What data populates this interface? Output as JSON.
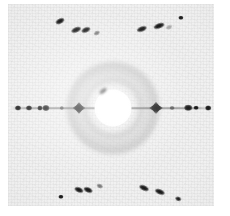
{
  "figure": {
    "kind": "x-ray-diffraction-pattern",
    "caption": "",
    "width": 230,
    "height": 216,
    "plate": {
      "x": 8,
      "y": 4,
      "width": 206,
      "height": 202
    },
    "background_color": "#f1f1f1",
    "page_color": "#ffffff",
    "spot_color": "#0c0c0c",
    "halo_color": "#787878",
    "beamstop_color": "#ffffff"
  },
  "chart_data": {
    "type": "scatter",
    "title": "",
    "subtitle": "",
    "xlabel": "",
    "ylabel": "",
    "grid": false,
    "legend": null,
    "xlim": [
      0,
      230
    ],
    "ylim": [
      0,
      216
    ],
    "annotations": [],
    "center": {
      "x": 113,
      "y": 108
    },
    "beamstop": {
      "cx": 113,
      "cy": 108,
      "r_white": 18.5,
      "r_ring": 23
    },
    "halo": [
      {
        "cx": 113,
        "cy": 108,
        "r": 46,
        "label": "outer diffuse ring"
      },
      {
        "cx": 113,
        "cy": 108,
        "r": 30,
        "label": "inner diffuse ring"
      }
    ],
    "layer_line": {
      "y": 108,
      "x0": 10,
      "x1": 212,
      "label": "horizontal layer line"
    },
    "series": [
      {
        "name": "equatorial reflections",
        "points": [
          {
            "x": 18,
            "y": 108,
            "rx": 3.0,
            "ry": 2.6,
            "rot": 0,
            "intensity": 0.85
          },
          {
            "x": 29,
            "y": 108,
            "rx": 3.0,
            "ry": 2.6,
            "rot": 0,
            "intensity": 0.9
          },
          {
            "x": 40,
            "y": 108,
            "rx": 2.6,
            "ry": 2.4,
            "rot": 0,
            "intensity": 0.8
          },
          {
            "x": 46,
            "y": 108,
            "rx": 3.6,
            "ry": 3.0,
            "rot": 0,
            "intensity": 1.0
          },
          {
            "x": 62,
            "y": 108,
            "rx": 2.2,
            "ry": 2.0,
            "rot": 0,
            "intensity": 0.7
          },
          {
            "x": 79,
            "y": 108,
            "rx": 6.5,
            "ry": 6.0,
            "rot": 0,
            "intensity": 1.0,
            "shape": "star"
          },
          {
            "x": 156,
            "y": 108,
            "rx": 7.0,
            "ry": 6.2,
            "rot": 0,
            "intensity": 1.0,
            "shape": "star"
          },
          {
            "x": 172,
            "y": 108,
            "rx": 2.4,
            "ry": 2.1,
            "rot": 0,
            "intensity": 0.72
          },
          {
            "x": 188,
            "y": 108,
            "rx": 3.8,
            "ry": 3.2,
            "rot": 0,
            "intensity": 1.0
          },
          {
            "x": 196,
            "y": 108,
            "rx": 2.4,
            "ry": 2.2,
            "rot": 0,
            "intensity": 0.78
          },
          {
            "x": 208,
            "y": 108,
            "rx": 2.8,
            "ry": 2.5,
            "rot": 0,
            "intensity": 0.85
          }
        ]
      },
      {
        "name": "upper-left quadrant cluster",
        "points": [
          {
            "x": 60,
            "y": 21,
            "rx": 4.6,
            "ry": 2.4,
            "rot": -27,
            "intensity": 0.95
          },
          {
            "x": 76,
            "y": 30,
            "rx": 4.8,
            "ry": 2.6,
            "rot": -22,
            "intensity": 1.0
          },
          {
            "x": 86,
            "y": 30,
            "rx": 4.6,
            "ry": 2.6,
            "rot": -22,
            "intensity": 1.0
          },
          {
            "x": 97,
            "y": 33,
            "rx": 3.2,
            "ry": 2.0,
            "rot": -25,
            "intensity": 0.62
          }
        ]
      },
      {
        "name": "upper-right quadrant cluster",
        "points": [
          {
            "x": 142,
            "y": 29,
            "rx": 5.2,
            "ry": 2.5,
            "rot": -20,
            "intensity": 1.0
          },
          {
            "x": 159,
            "y": 26,
            "rx": 5.4,
            "ry": 2.6,
            "rot": -20,
            "intensity": 1.0
          },
          {
            "x": 169,
            "y": 27,
            "rx": 3.0,
            "ry": 1.8,
            "rot": -22,
            "intensity": 0.45
          },
          {
            "x": 181,
            "y": 18,
            "rx": 2.6,
            "ry": 2.2,
            "rot": 0,
            "intensity": 0.8
          }
        ]
      },
      {
        "name": "lower-left quadrant cluster",
        "points": [
          {
            "x": 61,
            "y": 197,
            "rx": 2.6,
            "ry": 2.2,
            "rot": 0,
            "intensity": 0.8
          },
          {
            "x": 79,
            "y": 190,
            "rx": 4.6,
            "ry": 2.6,
            "rot": 22,
            "intensity": 1.0
          },
          {
            "x": 88,
            "y": 190,
            "rx": 4.4,
            "ry": 2.6,
            "rot": 22,
            "intensity": 1.0
          },
          {
            "x": 100,
            "y": 186,
            "rx": 3.2,
            "ry": 1.9,
            "rot": 20,
            "intensity": 0.55
          }
        ]
      },
      {
        "name": "lower-right quadrant cluster",
        "points": [
          {
            "x": 144,
            "y": 188,
            "rx": 5.0,
            "ry": 2.5,
            "rot": 24,
            "intensity": 1.0
          },
          {
            "x": 160,
            "y": 192,
            "rx": 5.2,
            "ry": 2.6,
            "rot": 22,
            "intensity": 1.0
          },
          {
            "x": 178,
            "y": 199,
            "rx": 2.8,
            "ry": 2.2,
            "rot": 18,
            "intensity": 0.78
          }
        ]
      }
    ]
  }
}
